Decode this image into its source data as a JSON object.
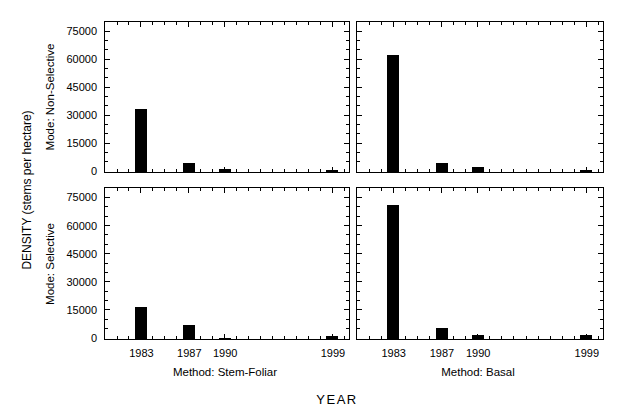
{
  "chart_data": {
    "type": "bar",
    "layout": "2x2-small-multiples",
    "title": "",
    "xlabel": "YEAR",
    "ylabel": "DENSITY (stems per hectare)",
    "rows": [
      "Mode: Non-Selective",
      "Mode: Selective"
    ],
    "cols": [
      "Method: Stem-Foliar",
      "Method: Basal"
    ],
    "x": [
      1983,
      1987,
      1990,
      1999
    ],
    "xticks": [
      1983,
      1987,
      1990,
      1999
    ],
    "yticks": [
      0,
      15000,
      30000,
      45000,
      60000,
      75000
    ],
    "xlim": [
      1980,
      2000.3
    ],
    "ylim": [
      0,
      80000
    ],
    "minor_x_step_years": 1,
    "minor_y_step": 5000,
    "grid": "off",
    "bar_color": "#000000",
    "panels": [
      {
        "row": "Mode: Non-Selective",
        "col": "Method: Stem-Foliar",
        "values": [
          34000,
          4800,
          1400,
          1200
        ]
      },
      {
        "row": "Mode: Non-Selective",
        "col": "Method: Basal",
        "values": [
          63000,
          4600,
          2600,
          1100
        ]
      },
      {
        "row": "Mode: Selective",
        "col": "Method: Stem-Foliar",
        "values": [
          17000,
          7500,
          600,
          1700
        ]
      },
      {
        "row": "Mode: Selective",
        "col": "Method: Basal",
        "values": [
          71500,
          5800,
          1900,
          2300
        ]
      }
    ]
  }
}
